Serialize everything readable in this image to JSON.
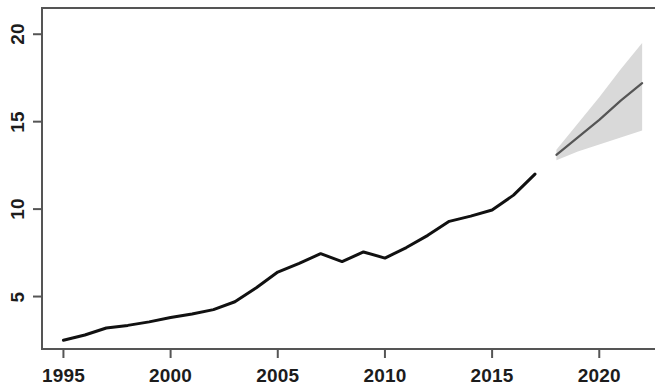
{
  "figure": {
    "background": "#ffffff",
    "frame_color": "#555555",
    "history_color": "#111111",
    "forecast_line_color": "#555555",
    "forecast_band_color": "#d9d9d9"
  },
  "axes": {
    "x_tick_labels": [
      "1995",
      "2000",
      "2005",
      "2010",
      "2015",
      "2020"
    ],
    "x_tick_values": [
      1995,
      2000,
      2005,
      2010,
      2015,
      2020
    ],
    "y_tick_labels": [
      "5",
      "10",
      "15",
      "20"
    ],
    "y_tick_values": [
      5,
      10,
      15,
      20
    ]
  },
  "chart_data": {
    "type": "line",
    "title": "",
    "subtitle": "",
    "xlabel": "",
    "ylabel": "",
    "xlim": [
      1994.0,
      2022.6
    ],
    "ylim": [
      2.0,
      21.5
    ],
    "grid": false,
    "legend": "none",
    "x_ticks": [
      1995,
      2000,
      2005,
      2010,
      2015,
      2020
    ],
    "y_ticks": [
      5,
      10,
      15,
      20
    ],
    "series": [
      {
        "name": "historical",
        "type": "line",
        "color": "#111111",
        "x": [
          1995,
          1996,
          1997,
          1998,
          1999,
          2000,
          2001,
          2002,
          2003,
          2004,
          2005,
          2006,
          2007,
          2008,
          2009,
          2010,
          2011,
          2012,
          2013,
          2014,
          2015,
          2016,
          2017
        ],
        "values": [
          2.5,
          2.8,
          3.2,
          3.35,
          3.55,
          3.8,
          4.0,
          4.25,
          4.7,
          5.5,
          6.4,
          6.9,
          7.45,
          7.0,
          7.55,
          7.2,
          7.8,
          8.5,
          9.3,
          9.6,
          9.95,
          10.8,
          12.0
        ]
      },
      {
        "name": "forecast",
        "type": "line",
        "color": "#555555",
        "x": [
          2018,
          2019,
          2020,
          2021,
          2022
        ],
        "values": [
          13.1,
          14.1,
          15.1,
          16.2,
          17.2
        ]
      }
    ],
    "bands": [
      {
        "name": "forecast-interval",
        "color": "#d9d9d9",
        "x": [
          2018,
          2019,
          2020,
          2021,
          2022
        ],
        "lower": [
          12.8,
          13.3,
          13.7,
          14.1,
          14.5
        ],
        "upper": [
          13.4,
          14.9,
          16.4,
          18.0,
          19.5
        ]
      }
    ]
  }
}
